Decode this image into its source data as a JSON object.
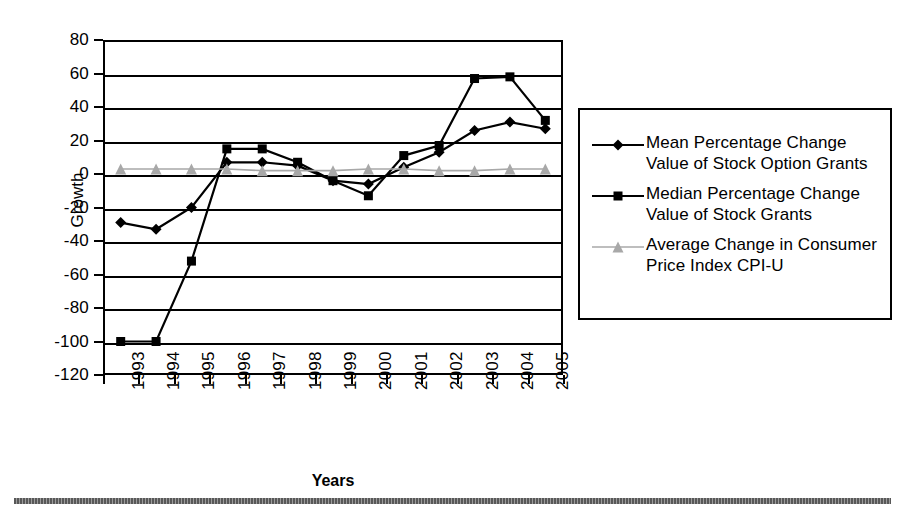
{
  "axes": {
    "y_title": "Growth",
    "x_title": "Years",
    "y_ticks": [
      "80",
      "60",
      "40",
      "20",
      "0",
      "-20",
      "-40",
      "-60",
      "-80",
      "-100",
      "-120"
    ],
    "x_ticks": [
      "1993",
      "1994",
      "1995",
      "1996",
      "1997",
      "1998",
      "1999",
      "2000",
      "2001",
      "2002",
      "2003",
      "2004",
      "2005"
    ]
  },
  "legend": {
    "items": [
      {
        "label_line1": "Mean Percentage Change",
        "label_line2": "Value of Stock Option Grants",
        "marker": "diamond-marker",
        "color": "#000000"
      },
      {
        "label_line1": "Median Percentage Change",
        "label_line2": "Value of Stock Grants",
        "marker": "square-marker",
        "color": "#000000"
      },
      {
        "label_line1": "Average Change in Consumer",
        "label_line2": "Price Index CPI-U",
        "marker": "triangle-marker",
        "color": "#a8a8a8"
      }
    ]
  },
  "chart_data": {
    "type": "line",
    "title": "",
    "xlabel": "Years",
    "ylabel": "Growth",
    "ylim": [
      -120,
      80
    ],
    "ytick_step": 20,
    "grid": true,
    "legend_position": "right",
    "categories": [
      "1993",
      "1994",
      "1995",
      "1996",
      "1997",
      "1998",
      "1999",
      "2000",
      "2001",
      "2002",
      "2003",
      "2004",
      "2005"
    ],
    "series": [
      {
        "name": "Mean Percentage Change Value of Stock Option Grants",
        "marker": "diamond",
        "color": "#000000",
        "values": [
          -29,
          -33,
          -20,
          7,
          7,
          5,
          -4,
          -6,
          4,
          13,
          26,
          31,
          27
        ]
      },
      {
        "name": "Median Percentage Change Value of Stock Grants",
        "marker": "square",
        "color": "#000000",
        "values": [
          -100,
          -100,
          -52,
          15,
          15,
          7,
          -4,
          -13,
          11,
          17,
          57,
          58,
          32
        ]
      },
      {
        "name": "Average Change in Consumer Price Index CPI-U",
        "marker": "triangle",
        "color": "#a8a8a8",
        "values": [
          3,
          3,
          3,
          3,
          2,
          2,
          2,
          3,
          3,
          2,
          2,
          3,
          3
        ]
      }
    ]
  }
}
